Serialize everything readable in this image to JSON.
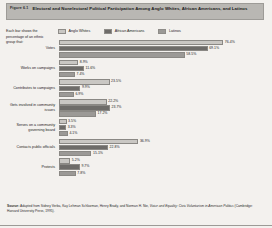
{
  "figure": {
    "number": "Figure 6.1",
    "title": "Electoral and Nonelectoral Political Participation Among Anglo Whites, African Americans, and Latinos",
    "note": "Each bar shows the percentage of an ethnic group that:",
    "source_label": "Source:",
    "source_pre": " Adapted from Sidney Verba, Kay Lehman Schlozman, Henry Brady, and Norman H. Nie, ",
    "source_title": "Voice and Equality: Civic Voluntarism in American Politics",
    "source_post": " (Cambridge: Harvard University Press, 1995)."
  },
  "colors": {
    "anglo_whites": "#c9c7c3",
    "african_americans": "#6e6c69",
    "latinos": "#9b9996",
    "title_bar": "#b9b7b3",
    "page_background": "#f3f1ee"
  },
  "legend": [
    {
      "label": "Anglo Whites",
      "color": "#c9c7c3"
    },
    {
      "label": "African Americans",
      "color": "#6e6c69"
    },
    {
      "label": "Latinos",
      "color": "#9b9996"
    }
  ],
  "chart_data": {
    "type": "bar",
    "title": "Electoral and Nonelectoral Political Participation Among Anglo Whites, African Americans, and Latinos",
    "xlabel": "",
    "ylabel": "",
    "xlim": [
      0,
      80
    ],
    "grid": false,
    "legend_position": "top",
    "orientation": "horizontal",
    "categories": [
      "Votes",
      "Works on campaigns",
      "Contributes to campaigns",
      "Gets involved in community issues",
      "Serves on a community governing board",
      "Contacts public officials",
      "Protests"
    ],
    "series": [
      {
        "name": "Anglo Whites",
        "values": [
          76.4,
          8.9,
          23.5,
          22.2,
          3.5,
          36.9,
          5.2
        ]
      },
      {
        "name": "African Americans",
        "values": [
          69.1,
          11.6,
          9.9,
          23.7,
          3.3,
          22.8,
          9.7
        ]
      },
      {
        "name": "Latinos",
        "values": [
          58.5,
          7.4,
          6.9,
          17.2,
          4.1,
          15.1,
          7.8
        ]
      }
    ],
    "value_labels": [
      [
        "76.4%",
        "69.1%",
        "58.5%"
      ],
      [
        "8.9%",
        "11.6%",
        "7.4%"
      ],
      [
        "23.5%",
        "9.9%",
        "6.9%"
      ],
      [
        "22.2%",
        "23.7%",
        "17.2%"
      ],
      [
        "3.5%",
        "3.3%",
        "4.1%"
      ],
      [
        "36.9%",
        "22.8%",
        "15.1%"
      ],
      [
        "5.2%",
        "9.7%",
        "7.8%"
      ]
    ]
  }
}
